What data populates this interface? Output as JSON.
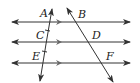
{
  "diagram": {
    "parallel_lines": [
      {
        "id": "line-1",
        "y": 22,
        "x1": 12,
        "x2": 130
      },
      {
        "id": "line-2",
        "y": 42,
        "x1": 12,
        "x2": 130
      },
      {
        "id": "line-3",
        "y": 63,
        "x1": 12,
        "x2": 130
      }
    ],
    "transversals": [
      {
        "id": "transversal-left",
        "x1": 52,
        "y1": 8,
        "x2": 40,
        "y2": 81
      },
      {
        "id": "transversal-right",
        "x1": 67,
        "y1": 8,
        "x2": 113,
        "y2": 82
      }
    ],
    "labels": [
      {
        "text": "A",
        "x": 40,
        "y": 17
      },
      {
        "text": "B",
        "x": 78,
        "y": 18
      },
      {
        "text": "C",
        "x": 36,
        "y": 39
      },
      {
        "text": "D",
        "x": 92,
        "y": 39
      },
      {
        "text": "E",
        "x": 32,
        "y": 60
      },
      {
        "text": "F",
        "x": 106,
        "y": 60
      }
    ],
    "colors": {
      "stroke": "#333333",
      "background": "#ffffff"
    }
  }
}
